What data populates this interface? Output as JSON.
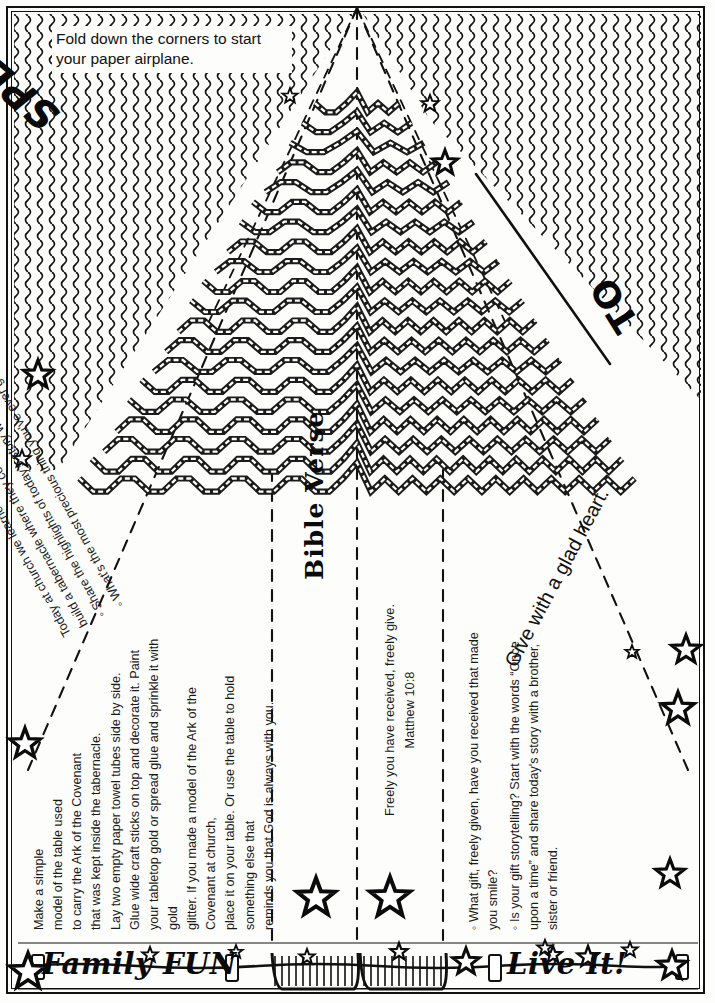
{
  "page": {
    "background_color": "#fdfdfb",
    "ink_color": "#111111"
  },
  "header": {
    "instruction": "Fold down the corners to start your paper airplane."
  },
  "banner": {
    "special_delivery": "SPECIAL DELIVERY",
    "to_label": "TO",
    "glad_heart": "Give with a glad heart."
  },
  "intro": {
    "paragraph": "Today at church we learned how the Israelites gave gifts to build a tabernacle where they could worship God.",
    "bullets": [
      "Share the highlights of today's story with your family.",
      "What's the most precious thing you've ever given to God?"
    ]
  },
  "family_fun": {
    "heading": "Family FUN",
    "lines": [
      "Make a simple",
      "model of the table used",
      "to carry the Ark of the Covenant",
      "that was kept inside the tabernacle.",
      "Lay two empty paper towel tubes side by side.",
      "Glue wide craft sticks on top and decorate it. Paint",
      "your tabletop gold or spread glue and sprinkle it with gold",
      "glitter. If you made a model of the Ark of the Covenant at church,",
      "place it on your table. Or use the table to hold something else that",
      "reminds you that God is always with you."
    ]
  },
  "bible_verse": {
    "heading": "Bible Verse",
    "text": "Freely you have received, freely give.",
    "reference": "Matthew 10:8"
  },
  "live_it": {
    "heading": "Live It!",
    "bullets": [
      "What gift, freely given, have you received that made you smile?",
      "Is your gift storytelling? Start with the words “Once upon a time” and share today's story with a brother, sister or friend."
    ]
  },
  "icons": {
    "star": "star-icon",
    "fold_line": "fold-dashed-line",
    "chevron": "chevron-ribbon",
    "clothespin": "clothespin-icon",
    "fringe": "fringe-icon"
  }
}
